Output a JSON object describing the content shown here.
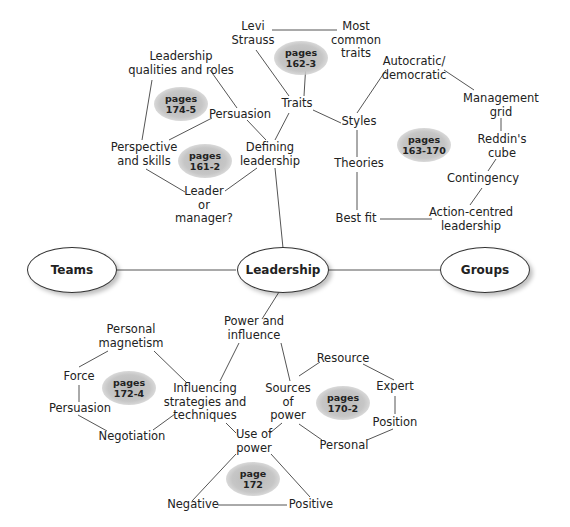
{
  "central": {
    "leadership": "Leadership",
    "teams": "Teams",
    "groups": "Groups"
  },
  "upper_left": {
    "leadership_qualities": "Leadership\nqualities and roles",
    "persuasion": "Persuasion",
    "perspective_skills": "Perspective\nand skills",
    "defining_leadership": "Defining\nleadership",
    "leader_or_manager": "Leader\nor\nmanager?",
    "badge_174": "pages\n174-5",
    "badge_161": "pages\n161-2"
  },
  "upper_middle": {
    "levi_strauss": "Levi\nStrauss",
    "most_common_traits": "Most\ncommon\ntraits",
    "traits": "Traits",
    "badge_162": "pages\n162-3"
  },
  "upper_right": {
    "styles": "Styles",
    "theories": "Theories",
    "best_fit": "Best fit",
    "autocratic": "Autocratic/\ndemocratic",
    "management_grid": "Management\ngrid",
    "reddins_cube": "Reddin's\ncube",
    "contingency": "Contingency",
    "action_centred": "Action-centred\nleadership",
    "badge_163": "pages\n163-170"
  },
  "lower": {
    "power_influence": "Power and\ninfluence",
    "influencing": "Influencing\nstrategies and\ntechniques",
    "personal_magnetism": "Personal\nmagnetism",
    "force": "Force",
    "persuasion": "Persuasion",
    "negotiation": "Negotiation",
    "sources_of_power": "Sources\nof\npower",
    "resource": "Resource",
    "expert": "Expert",
    "position": "Position",
    "personal": "Personal",
    "use_of_power": "Use of\npower",
    "negative": "Negative",
    "positive": "Positive",
    "badge_172_4": "pages\n172-4",
    "badge_170": "pages\n170-2",
    "badge_172": "page\n172"
  },
  "colors": {
    "line": "#555555",
    "badge": "#bdbdbd",
    "text": "#222222"
  }
}
